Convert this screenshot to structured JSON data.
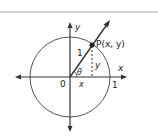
{
  "diagram": {
    "type": "unit-circle",
    "labels": {
      "y_axis": "y",
      "x_axis": "x",
      "origin": "0",
      "radius": "1",
      "x_intercept": "1",
      "point": "P(x, y)",
      "angle": "θ",
      "x_leg": "x",
      "y_leg": "y"
    },
    "colors": {
      "stroke": "#333333",
      "circle": "#555555",
      "top_rule": "#999999"
    }
  }
}
